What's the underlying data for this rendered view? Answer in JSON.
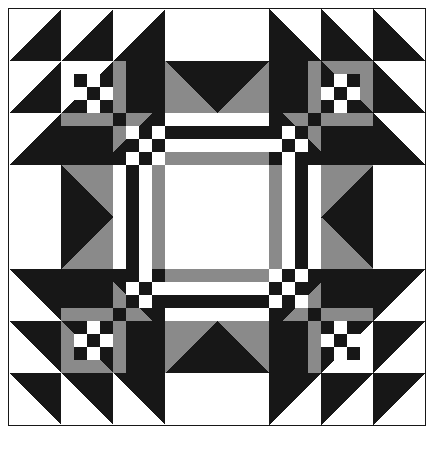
{
  "figure": {
    "kind": "quilt-block-diagram",
    "title": "",
    "width": 435,
    "height": 455
  },
  "colors": {
    "dark": "#171717",
    "light": "#ffffff",
    "medium": "#8a8a8a",
    "outline": "#171717",
    "page_background": "#ffffff"
  },
  "grid": {
    "origin_x": 8,
    "origin_y": 8,
    "size_px": 416,
    "cells": 32,
    "cell_px": 13,
    "major_units": 8,
    "major_unit_px": 52,
    "border_width": 1
  },
  "legend": {
    "dark_label": "dark",
    "light_label": "light",
    "medium_label": "medium"
  },
  "chart_data": {
    "type": "heatmap",
    "title": "",
    "xlabel": "",
    "ylabel": "",
    "grid": true,
    "legend_position": "none",
    "palette": {
      "D": "#171717",
      "L": "#ffffff",
      "M": "#8a8a8a"
    },
    "shapes": [
      {
        "name": "hst-top-row-1",
        "kind": "half-square-triangle",
        "x": 0,
        "y": 0,
        "w": 4,
        "h": 4,
        "corner": "br",
        "fill": "D",
        "back": "L"
      },
      {
        "name": "hst-top-row-2",
        "kind": "half-square-triangle",
        "x": 4,
        "y": 0,
        "w": 4,
        "h": 4,
        "corner": "br",
        "fill": "D",
        "back": "L"
      },
      {
        "name": "hst-top-row-3",
        "kind": "half-square-triangle",
        "x": 8,
        "y": 0,
        "w": 4,
        "h": 4,
        "corner": "br",
        "fill": "D",
        "back": "L"
      },
      {
        "name": "plain-top-center",
        "kind": "rect",
        "x": 12,
        "y": 0,
        "w": 8,
        "h": 4,
        "fill": "L"
      },
      {
        "name": "hst-top-row-4",
        "kind": "half-square-triangle",
        "x": 20,
        "y": 0,
        "w": 4,
        "h": 4,
        "corner": "bl",
        "fill": "D",
        "back": "L"
      },
      {
        "name": "hst-top-row-5",
        "kind": "half-square-triangle",
        "x": 24,
        "y": 0,
        "w": 4,
        "h": 4,
        "corner": "bl",
        "fill": "D",
        "back": "L"
      },
      {
        "name": "hst-top-row-6",
        "kind": "half-square-triangle",
        "x": 28,
        "y": 0,
        "w": 4,
        "h": 4,
        "corner": "bl",
        "fill": "D",
        "back": "L"
      },
      {
        "name": "hst-left-col-1",
        "kind": "half-square-triangle",
        "x": 0,
        "y": 4,
        "w": 4,
        "h": 4,
        "corner": "br",
        "fill": "D",
        "back": "L"
      },
      {
        "name": "hst-left-col-2",
        "kind": "half-square-triangle",
        "x": 0,
        "y": 8,
        "w": 4,
        "h": 4,
        "corner": "br",
        "fill": "D",
        "back": "L"
      },
      {
        "name": "plain-left-center",
        "kind": "rect",
        "x": 0,
        "y": 12,
        "w": 4,
        "h": 8,
        "fill": "L"
      },
      {
        "name": "hst-left-col-3",
        "kind": "half-square-triangle",
        "x": 0,
        "y": 20,
        "w": 4,
        "h": 4,
        "corner": "tr",
        "fill": "D",
        "back": "L"
      },
      {
        "name": "hst-left-col-4",
        "kind": "half-square-triangle",
        "x": 0,
        "y": 24,
        "w": 4,
        "h": 4,
        "corner": "tr",
        "fill": "D",
        "back": "L"
      },
      {
        "name": "hst-bottom-left-corner",
        "kind": "half-square-triangle",
        "x": 0,
        "y": 28,
        "w": 4,
        "h": 4,
        "corner": "tr",
        "fill": "D",
        "back": "L"
      },
      {
        "name": "hst-right-col-1",
        "kind": "half-square-triangle",
        "x": 28,
        "y": 4,
        "w": 4,
        "h": 4,
        "corner": "bl",
        "fill": "D",
        "back": "L"
      },
      {
        "name": "hst-right-col-2",
        "kind": "half-square-triangle",
        "x": 28,
        "y": 8,
        "w": 4,
        "h": 4,
        "corner": "bl",
        "fill": "D",
        "back": "L"
      },
      {
        "name": "plain-right-center",
        "kind": "rect",
        "x": 28,
        "y": 12,
        "w": 4,
        "h": 8,
        "fill": "L"
      },
      {
        "name": "hst-right-col-3",
        "kind": "half-square-triangle",
        "x": 28,
        "y": 20,
        "w": 4,
        "h": 4,
        "corner": "tl",
        "fill": "D",
        "back": "L"
      },
      {
        "name": "hst-right-col-4",
        "kind": "half-square-triangle",
        "x": 28,
        "y": 24,
        "w": 4,
        "h": 4,
        "corner": "tl",
        "fill": "D",
        "back": "L"
      },
      {
        "name": "hst-bottom-right-corner",
        "kind": "half-square-triangle",
        "x": 28,
        "y": 28,
        "w": 4,
        "h": 4,
        "corner": "tl",
        "fill": "D",
        "back": "L"
      },
      {
        "name": "hst-bottom-row-1",
        "kind": "half-square-triangle",
        "x": 4,
        "y": 28,
        "w": 4,
        "h": 4,
        "corner": "tr",
        "fill": "D",
        "back": "L"
      },
      {
        "name": "hst-bottom-row-2",
        "kind": "half-square-triangle",
        "x": 8,
        "y": 28,
        "w": 4,
        "h": 4,
        "corner": "tr",
        "fill": "D",
        "back": "L"
      },
      {
        "name": "plain-bottom-center",
        "kind": "rect",
        "x": 12,
        "y": 28,
        "w": 8,
        "h": 4,
        "fill": "L"
      },
      {
        "name": "hst-bottom-row-3",
        "kind": "half-square-triangle",
        "x": 20,
        "y": 28,
        "w": 4,
        "h": 4,
        "corner": "tl",
        "fill": "D",
        "back": "L"
      },
      {
        "name": "hst-bottom-row-4",
        "kind": "half-square-triangle",
        "x": 24,
        "y": 28,
        "w": 4,
        "h": 4,
        "corner": "tl",
        "fill": "D",
        "back": "L"
      },
      {
        "name": "goose-top-left",
        "kind": "half-square-triangle",
        "x": 12,
        "y": 4,
        "w": 4,
        "h": 4,
        "corner": "tl",
        "fill": "D",
        "back": "M"
      },
      {
        "name": "goose-top-right",
        "kind": "half-square-triangle",
        "x": 16,
        "y": 4,
        "w": 4,
        "h": 4,
        "corner": "tr",
        "fill": "D",
        "back": "M"
      },
      {
        "name": "goose-bottom-left",
        "kind": "half-square-triangle",
        "x": 12,
        "y": 24,
        "w": 4,
        "h": 4,
        "corner": "bl",
        "fill": "D",
        "back": "M"
      },
      {
        "name": "goose-bottom-right",
        "kind": "half-square-triangle",
        "x": 16,
        "y": 24,
        "w": 4,
        "h": 4,
        "corner": "br",
        "fill": "D",
        "back": "M"
      },
      {
        "name": "goose-left-top",
        "kind": "half-square-triangle",
        "x": 4,
        "y": 12,
        "w": 4,
        "h": 4,
        "corner": "tl",
        "fill": "D",
        "back": "M"
      },
      {
        "name": "goose-left-bottom",
        "kind": "half-square-triangle",
        "x": 4,
        "y": 16,
        "w": 4,
        "h": 4,
        "corner": "bl",
        "fill": "D",
        "back": "M"
      },
      {
        "name": "goose-right-top",
        "kind": "half-square-triangle",
        "x": 24,
        "y": 12,
        "w": 4,
        "h": 4,
        "corner": "tr",
        "fill": "D",
        "back": "M"
      },
      {
        "name": "goose-right-bottom",
        "kind": "half-square-triangle",
        "x": 24,
        "y": 16,
        "w": 4,
        "h": 4,
        "corner": "br",
        "fill": "D",
        "back": "M"
      },
      {
        "name": "center-square-light",
        "kind": "rect",
        "x": 13,
        "y": 13,
        "w": 6,
        "h": 6,
        "fill": "L"
      },
      {
        "name": "center-frame-medium-top",
        "kind": "rect",
        "x": 12,
        "y": 12,
        "w": 8,
        "h": 1,
        "fill": "M"
      },
      {
        "name": "center-frame-medium-bottom",
        "kind": "rect",
        "x": 12,
        "y": 19,
        "w": 8,
        "h": 1,
        "fill": "M"
      },
      {
        "name": "center-frame-medium-left",
        "kind": "rect",
        "x": 12,
        "y": 13,
        "w": 1,
        "h": 6,
        "fill": "M"
      },
      {
        "name": "center-frame-medium-right",
        "kind": "rect",
        "x": 19,
        "y": 13,
        "w": 1,
        "h": 6,
        "fill": "M"
      }
    ],
    "corner_nine_patch": {
      "description": "4x4 checkerboard units in each corner chain",
      "rows": 4,
      "cols": 4
    }
  }
}
